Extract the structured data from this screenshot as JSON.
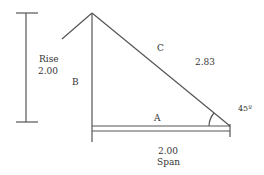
{
  "diagram": {
    "labels": {
      "rise_title": "Rise",
      "rise_value": "2.00",
      "side_b": "B",
      "side_c": "C",
      "hypotenuse_value": "2.83",
      "side_a": "A",
      "angle": "45º",
      "span_value": "2.00",
      "span_title": "Span"
    },
    "colors": {
      "stroke": "#555555",
      "text": "#333333"
    }
  }
}
